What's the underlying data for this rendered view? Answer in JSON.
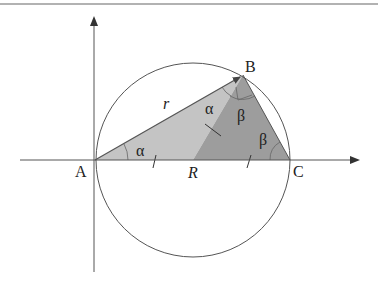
{
  "figure": {
    "points": {
      "A": {
        "label": "A",
        "x": 95,
        "y": 160
      },
      "B": {
        "label": "B",
        "x": 243,
        "y": 75
      },
      "C": {
        "label": "C",
        "x": 290,
        "y": 160
      },
      "R": {
        "label": "R",
        "x": 193,
        "y": 160
      }
    },
    "labels": {
      "r": "r",
      "alpha": "α",
      "beta": "β"
    },
    "colors": {
      "light_fill": "#bdbdbd",
      "dark_fill": "#9a9a9a",
      "stroke": "#555555",
      "axis": "#555555",
      "top_rule": "#888888"
    },
    "circle": {
      "cx": 193,
      "cy": 160,
      "r": 97
    }
  }
}
